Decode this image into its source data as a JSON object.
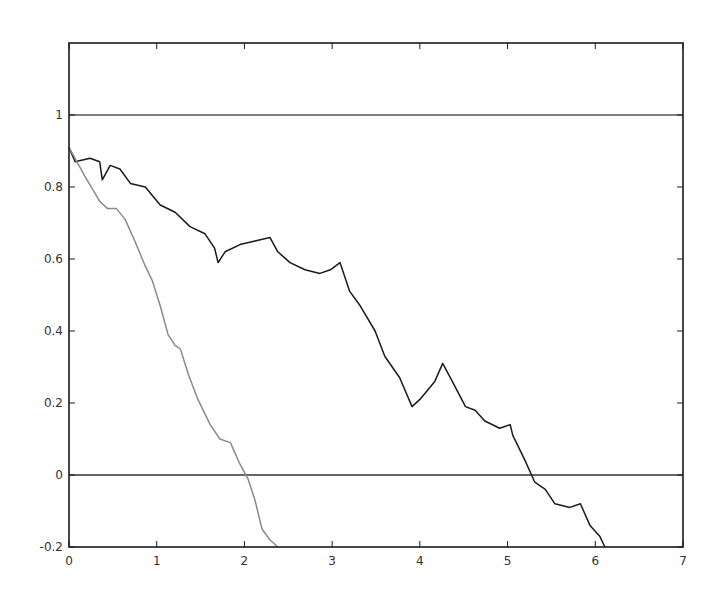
{
  "chart_data": {
    "type": "line",
    "title": "",
    "xlabel": "",
    "ylabel": "",
    "xlim": [
      0,
      7
    ],
    "ylim": [
      -0.2,
      1.2
    ],
    "grid": false,
    "legend": null,
    "x_ticks": [
      0,
      1,
      2,
      3,
      4,
      5,
      6,
      7
    ],
    "x_tick_labels": [
      "0",
      "1",
      "2",
      "3",
      "4",
      "5",
      "6",
      "7"
    ],
    "y_ticks": [
      -0.2,
      0,
      0.2,
      0.4,
      0.6,
      0.8,
      1
    ],
    "y_tick_labels": [
      "-0.2",
      "0",
      "0.2",
      "0.4",
      "0.6",
      "0.8",
      "1"
    ],
    "reference_lines": [
      {
        "name": "upper-boundary",
        "y": 1,
        "color": "#555555"
      },
      {
        "name": "lower-boundary",
        "y": 0,
        "color": "#333333"
      }
    ],
    "series": [
      {
        "name": "dark-path",
        "color": "#1a1a1a",
        "x": [
          0,
          0.07,
          0.24,
          0.35,
          0.38,
          0.47,
          0.58,
          0.7,
          0.87,
          1.04,
          1.21,
          1.38,
          1.55,
          1.66,
          1.7,
          1.78,
          1.95,
          2.12,
          2.29,
          2.38,
          2.52,
          2.69,
          2.86,
          2.98,
          3.09,
          3.2,
          3.32,
          3.49,
          3.6,
          3.77,
          3.91,
          4.0,
          4.17,
          4.26,
          4.37,
          4.52,
          4.63,
          4.74,
          4.91,
          5.03,
          5.06,
          5.2,
          5.31,
          5.43,
          5.54,
          5.71,
          5.83,
          5.94,
          6.05,
          6.11
        ],
        "y": [
          0.91,
          0.87,
          0.88,
          0.87,
          0.82,
          0.86,
          0.85,
          0.81,
          0.8,
          0.75,
          0.73,
          0.69,
          0.67,
          0.63,
          0.59,
          0.62,
          0.64,
          0.65,
          0.66,
          0.62,
          0.59,
          0.57,
          0.56,
          0.57,
          0.59,
          0.51,
          0.47,
          0.4,
          0.33,
          0.27,
          0.19,
          0.21,
          0.26,
          0.31,
          0.26,
          0.19,
          0.18,
          0.15,
          0.13,
          0.14,
          0.11,
          0.04,
          -0.02,
          -0.04,
          -0.08,
          -0.09,
          -0.08,
          -0.14,
          -0.17,
          -0.2
        ]
      },
      {
        "name": "gray-path",
        "color": "#8a8a8a",
        "x": [
          0,
          0.18,
          0.35,
          0.44,
          0.54,
          0.64,
          0.75,
          0.87,
          0.95,
          1.04,
          1.13,
          1.21,
          1.27,
          1.36,
          1.47,
          1.61,
          1.72,
          1.84,
          1.95,
          2.04,
          2.12,
          2.2,
          2.29,
          2.38
        ],
        "y": [
          0.91,
          0.83,
          0.76,
          0.74,
          0.74,
          0.71,
          0.65,
          0.58,
          0.54,
          0.47,
          0.39,
          0.36,
          0.35,
          0.28,
          0.21,
          0.14,
          0.1,
          0.09,
          0.03,
          -0.01,
          -0.07,
          -0.15,
          -0.18,
          -0.2
        ]
      }
    ]
  },
  "plot_area_px": {
    "left": 69,
    "right": 683,
    "top": 43,
    "bottom": 547
  },
  "colors": {
    "axes": "#1a1a1a",
    "background": "#ffffff"
  }
}
